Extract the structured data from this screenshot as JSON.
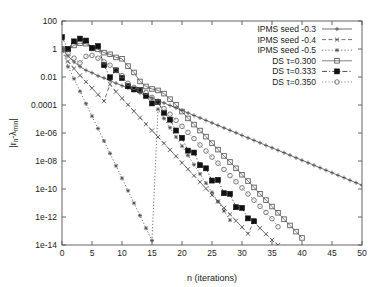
{
  "chart_data": {
    "type": "line",
    "title": "",
    "xlabel": "n (iterations)",
    "ylabel": "|r_n-λ_min|",
    "ylabel_parts": {
      "prefix": "|r",
      "sub1": "n",
      "mid": "-λ",
      "sub2": "min",
      "suffix": "|"
    },
    "xlim": [
      0,
      50
    ],
    "ylim": [
      1e-14,
      100
    ],
    "yscale": "log",
    "xscale": "linear",
    "grid": false,
    "legend_position": "top-right",
    "xticks": [
      0,
      5,
      10,
      15,
      20,
      25,
      30,
      35,
      40,
      45,
      50
    ],
    "xtick_labels": [
      "0",
      "5",
      "10",
      "15",
      "20",
      "25",
      "30",
      "35",
      "40",
      "45",
      "50"
    ],
    "yticks": [
      100,
      1,
      0.01,
      0.0001,
      1e-06,
      1e-08,
      1e-10,
      1e-12,
      1e-14
    ],
    "ytick_labels": [
      "100",
      "1",
      "0.01",
      "0.0001",
      "1e-06",
      "1e-08",
      "1e-10",
      "1e-12",
      "1e-14"
    ],
    "series": [
      {
        "name": "IPMS seed -0.3",
        "marker": "plus",
        "dash": "none",
        "color": "#444444",
        "x": [
          0,
          1,
          2,
          3,
          4,
          5,
          6,
          7,
          8,
          9,
          10,
          11,
          12,
          13,
          14,
          15,
          16,
          17,
          18,
          19,
          20,
          21,
          22,
          23,
          24,
          25,
          26,
          27,
          28,
          29,
          30,
          31,
          32,
          33,
          34,
          35,
          36,
          37,
          38,
          39,
          40,
          41,
          42,
          43,
          44,
          45,
          46,
          47,
          48,
          49,
          50
        ],
        "y": [
          1.0,
          0.32,
          0.12,
          0.055,
          0.03,
          0.02,
          0.012,
          0.0085,
          0.0055,
          0.0036,
          0.0024,
          0.0016,
          0.0011,
          0.00072,
          0.00048,
          0.00032,
          0.00021,
          0.00014,
          9.3e-05,
          6.2e-05,
          4.1e-05,
          2.7e-05,
          1.8e-05,
          1.2e-05,
          8e-06,
          5.3e-06,
          3.5e-06,
          2.3e-06,
          1.55e-06,
          1.03e-06,
          6.8e-07,
          4.5e-07,
          3e-07,
          2e-07,
          1.3e-07,
          8.8e-08,
          5.8e-08,
          3.9e-08,
          2.6e-08,
          1.7e-08,
          1.13e-08,
          7.5e-09,
          5e-09,
          3.3e-09,
          2.2e-09,
          1.45e-09,
          9.6e-10,
          6.4e-10,
          4.2e-10,
          2.8e-10,
          1.85e-10
        ]
      },
      {
        "name": "IPMS seed -0.4",
        "marker": "cross",
        "dash": "dashed",
        "color": "#444444",
        "x": [
          0,
          1,
          2,
          3,
          4,
          5,
          6,
          7,
          8,
          9,
          10,
          11,
          12,
          13,
          14,
          15,
          16,
          17,
          18,
          19,
          20,
          21,
          22,
          23,
          24,
          25,
          26,
          27,
          28,
          29,
          30,
          31,
          32,
          33,
          34,
          35,
          36
        ],
        "y": [
          1.0,
          0.13,
          0.04,
          0.013,
          0.0045,
          0.0016,
          0.00055,
          0.00019,
          0.003,
          0.0009,
          0.0003,
          0.000105,
          3.6e-05,
          1.25e-05,
          4.3e-06,
          1.5e-06,
          5.2e-07,
          1.8e-07,
          6.2e-08,
          2.2e-08,
          7.5e-09,
          2.6e-09,
          9e-10,
          3.1e-10,
          1.08e-10,
          3.7e-11,
          1.3e-11,
          4.5e-12,
          1.55e-12,
          5.4e-13,
          1.9e-13,
          6.5e-14,
          4.5e-13,
          1.6e-13,
          6e-14,
          2.3e-14,
          1e-14
        ]
      },
      {
        "name": "IPMS seed -0.5",
        "marker": "star",
        "dash": "dotted",
        "color": "#444444",
        "x": [
          0,
          1,
          2,
          3,
          4,
          5,
          6,
          7,
          8,
          9,
          10,
          11,
          12,
          13,
          14,
          15,
          16,
          17,
          18,
          19,
          20,
          21,
          22,
          23,
          24,
          25,
          26,
          27,
          28
        ],
        "y": [
          1.0,
          0.055,
          0.0075,
          0.00095,
          0.000125,
          1.6e-05,
          2.1e-06,
          2.7e-07,
          3.5e-08,
          4.5e-09,
          5.9e-10,
          7.6e-11,
          9.8e-12,
          1.27e-12,
          1.6e-13,
          2.1e-14,
          5e-05,
          1.1e-05,
          2.4e-06,
          5.2e-07,
          1.15e-07,
          2.5e-08,
          5.5e-09,
          1.2e-09,
          2.6e-10,
          5.7e-11,
          1.25e-11,
          2.7e-12,
          6e-13
        ]
      },
      {
        "name": "DS τ=0.300",
        "marker": "osquare",
        "dash": "none",
        "color": "#555555",
        "x": [
          0,
          1,
          2,
          3,
          4,
          5,
          6,
          7,
          8,
          9,
          10,
          11,
          12,
          13,
          14,
          15,
          16,
          17,
          18,
          19,
          20,
          21,
          22,
          23,
          24,
          25,
          26,
          27,
          28,
          29,
          30,
          31,
          32,
          33,
          34,
          35,
          36,
          37,
          38,
          39,
          40
        ],
        "y": [
          1.0,
          0.95,
          1.8,
          2.6,
          2.4,
          1.1,
          0.95,
          0.55,
          0.42,
          0.25,
          0.2,
          0.06,
          0.021,
          0.0048,
          0.0021,
          0.0014,
          0.0011,
          0.00065,
          0.00026,
          0.000105,
          3.4e-05,
          1.1e-05,
          4e-06,
          1.5e-06,
          5.5e-07,
          1.9e-07,
          6.5e-08,
          2.3e-08,
          8.5e-09,
          3e-09,
          1.05e-09,
          3.7e-10,
          1.3e-10,
          4.5e-11,
          1.6e-11,
          5.6e-12,
          2e-12,
          7e-13,
          2.5e-13,
          9e-14,
          3.2e-14
        ]
      },
      {
        "name": "DS τ=0.333",
        "marker": "fsquare",
        "dash": "dashdot",
        "color": "#111111",
        "x": [
          0,
          1,
          2,
          3,
          4,
          5,
          6,
          7,
          8,
          9,
          10,
          11,
          12,
          13,
          14,
          15,
          16,
          17,
          18,
          19,
          20,
          21,
          22,
          23,
          24,
          25,
          26,
          27,
          28,
          29,
          30,
          31,
          32
        ],
        "y": [
          7.0,
          1.0,
          3.5,
          5.5,
          4.0,
          1.2,
          1.6,
          0.07,
          0.0095,
          0.03,
          0.0085,
          0.0022,
          0.0013,
          0.0012,
          0.00045,
          0.00013,
          0.00016,
          2.8e-05,
          9e-06,
          1.5e-06,
          4.5e-07,
          5.5e-08,
          4e-08,
          5e-09,
          3e-09,
          4e-10,
          4.5e-10,
          5e-11,
          4.5e-11,
          5e-12,
          4.5e-12,
          8e-13,
          5e-13
        ]
      },
      {
        "name": "DS τ=0.350",
        "marker": "ocircle",
        "dash": "dotted",
        "color": "#666666",
        "x": [
          0,
          1,
          2,
          3,
          4,
          5,
          6,
          7,
          8,
          9,
          10,
          11,
          12,
          13,
          14,
          15,
          16,
          17,
          18,
          19,
          20,
          21,
          22,
          23,
          24,
          25,
          26,
          27,
          28,
          29,
          30,
          31,
          32,
          33,
          34,
          35,
          36
        ],
        "y": [
          1.0,
          0.5,
          0.22,
          0.1,
          0.3,
          0.35,
          0.22,
          0.12,
          0.07,
          0.03,
          0.0125,
          0.0035,
          0.0018,
          0.0012,
          0.0008,
          0.00035,
          0.00016,
          5.5e-05,
          2.2e-05,
          8e-06,
          3e-06,
          1.1e-06,
          4e-07,
          1.4e-07,
          5.2e-08,
          1.9e-08,
          7e-09,
          2.5e-09,
          9e-10,
          3.3e-10,
          1.2e-10,
          4.4e-11,
          1.6e-11,
          5.8e-12,
          2.1e-12,
          7.5e-13,
          2e-13
        ]
      }
    ]
  },
  "legend": {
    "items": [
      {
        "label": "IPMS seed -0.3"
      },
      {
        "label": "IPMS seed -0.4"
      },
      {
        "label": "IPMS seed -0.5"
      },
      {
        "label": "DS τ=0.300"
      },
      {
        "label": "DS τ=0.333"
      },
      {
        "label": "DS τ=0.350"
      }
    ]
  }
}
